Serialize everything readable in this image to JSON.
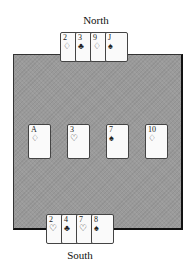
{
  "players": {
    "north": {
      "label": "North",
      "cards": [
        {
          "rank": "2",
          "suit": "♢",
          "suit_name": "diamonds"
        },
        {
          "rank": "3",
          "suit": "♣",
          "suit_name": "clubs"
        },
        {
          "rank": "9",
          "suit": "♢",
          "suit_name": "diamonds"
        },
        {
          "rank": "J",
          "suit": "♠",
          "suit_name": "spades"
        }
      ]
    },
    "south": {
      "label": "South",
      "cards": [
        {
          "rank": "2",
          "suit": "♡",
          "suit_name": "hearts"
        },
        {
          "rank": "4",
          "suit": "♣",
          "suit_name": "clubs"
        },
        {
          "rank": "7",
          "suit": "♡",
          "suit_name": "hearts"
        },
        {
          "rank": "8",
          "suit": "♠",
          "suit_name": "spades"
        }
      ]
    }
  },
  "table": {
    "cards": [
      {
        "rank": "A",
        "suit": "♢",
        "suit_name": "diamonds"
      },
      {
        "rank": "3",
        "suit": "♡",
        "suit_name": "hearts"
      },
      {
        "rank": "7",
        "suit": "♠",
        "suit_name": "spades"
      },
      {
        "rank": "10",
        "suit": "♢",
        "suit_name": "diamonds"
      }
    ]
  },
  "colors": {
    "table_felt": "#9a9a9a",
    "card_face": "#fafafa",
    "ink": "#222222"
  }
}
